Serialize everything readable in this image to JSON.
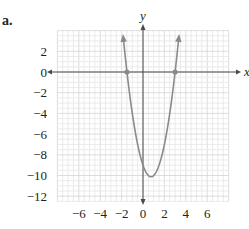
{
  "part_label": "a.",
  "chart_data": {
    "type": "line",
    "title": "",
    "xlabel": "x",
    "ylabel": "y",
    "xlim": [
      -8,
      8
    ],
    "ylim": [
      -12.5,
      4
    ],
    "grid": true,
    "grid_minor_step": 0.5,
    "x_ticks": [
      -6,
      -4,
      -2,
      0,
      2,
      4,
      6
    ],
    "x_tick_labels": [
      "−6",
      "−4",
      "−2",
      "0",
      "2",
      "4",
      "6"
    ],
    "y_ticks": [
      2,
      0,
      -2,
      -4,
      -6,
      -8,
      -10,
      -12
    ],
    "y_tick_labels": [
      "2",
      "0",
      "−2",
      "−4",
      "−6",
      "−8",
      "−10",
      "−12"
    ],
    "series": [
      {
        "name": "parabola",
        "equation": "y = 2x^2 - 3x - 9",
        "color": "#8a8a8a",
        "x_range": [
          -1.85,
          3.35
        ],
        "arrows_at_ends": true,
        "points": [
          {
            "x": -1.85,
            "y": 3.4
          },
          {
            "x": -1.5,
            "y": 0
          },
          {
            "x": -1,
            "y": -4
          },
          {
            "x": 0,
            "y": -9
          },
          {
            "x": 0.75,
            "y": -10.125
          },
          {
            "x": 1,
            "y": -10
          },
          {
            "x": 2,
            "y": -7
          },
          {
            "x": 3,
            "y": 0
          },
          {
            "x": 3.35,
            "y": 3.4
          }
        ]
      }
    ],
    "marked_points": [
      {
        "x": -1.5,
        "y": 0,
        "label": "x-intercept"
      },
      {
        "x": 3,
        "y": 0,
        "label": "x-intercept"
      }
    ],
    "vertex": {
      "x": 0.75,
      "y": -10.125
    }
  },
  "colors": {
    "grid_minor": "#e6e6e6",
    "grid_major": "#d4d4d4",
    "axis": "#4a4a4a",
    "curve": "#8a8a8a",
    "text": "#231f20"
  }
}
